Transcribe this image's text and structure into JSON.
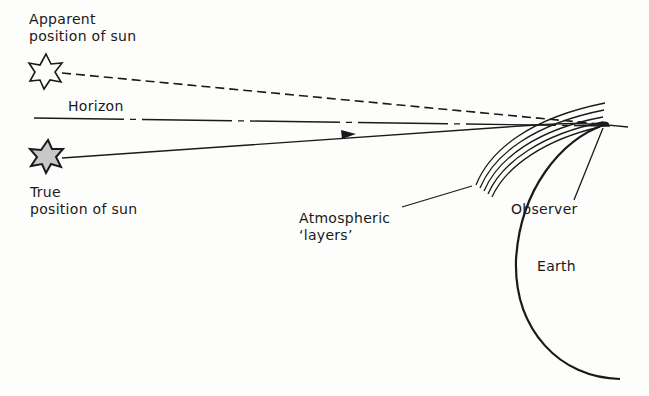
{
  "diagram": {
    "labels": {
      "apparent_line1": "Apparent",
      "apparent_line2": "position of sun",
      "horizon": "Horizon",
      "true_line1": "True",
      "true_line2": "position of sun",
      "atmos_line1": "Atmospheric",
      "atmos_line2": "‘layers’",
      "observer": "Observer",
      "earth": "Earth"
    },
    "colors": {
      "ink": "#1a1a1a",
      "background": "#fdfdfb",
      "true_sun_fill": "#c8c8c8"
    }
  }
}
